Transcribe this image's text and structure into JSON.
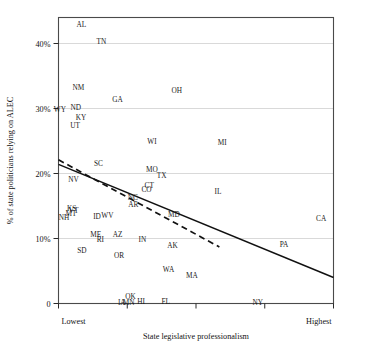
{
  "chart_data": {
    "type": "scatter",
    "title": "",
    "xlabel": "State legislative professionalism",
    "ylabel": "% of state politicians relying on ALEC",
    "xlim": [
      0,
      1
    ],
    "ylim": [
      0,
      0.44
    ],
    "grid": true,
    "legend": "none",
    "x_tick_labels": [
      "Lowest",
      "Highest"
    ],
    "x_tick_count": 5,
    "y_tick_labels": [
      "0",
      "10%",
      "20%",
      "30%",
      "40%"
    ],
    "y_tick_values": [
      0,
      10,
      20,
      30,
      40
    ],
    "point_label_field": "state",
    "points": [
      {
        "state": "AL",
        "x": 0.083,
        "y": 43.0
      },
      {
        "state": "TN",
        "x": 0.156,
        "y": 40.3
      },
      {
        "state": "NM",
        "x": 0.072,
        "y": 33.2
      },
      {
        "state": "OH",
        "x": 0.43,
        "y": 32.8
      },
      {
        "state": "GA",
        "x": 0.215,
        "y": 31.4
      },
      {
        "state": "WY",
        "x": 0.005,
        "y": 29.9
      },
      {
        "state": "ND",
        "x": 0.063,
        "y": 30.2
      },
      {
        "state": "KY",
        "x": 0.082,
        "y": 28.6
      },
      {
        "state": "UT",
        "x": 0.06,
        "y": 27.4
      },
      {
        "state": "WI",
        "x": 0.34,
        "y": 24.9
      },
      {
        "state": "MI",
        "x": 0.595,
        "y": 24.8
      },
      {
        "state": "SC",
        "x": 0.145,
        "y": 21.5
      },
      {
        "state": "MO",
        "x": 0.34,
        "y": 20.6
      },
      {
        "state": "TX",
        "x": 0.375,
        "y": 19.7
      },
      {
        "state": "NV",
        "x": 0.055,
        "y": 19.1
      },
      {
        "state": "CT",
        "x": 0.33,
        "y": 18.2
      },
      {
        "state": "CO",
        "x": 0.32,
        "y": 17.5
      },
      {
        "state": "IL",
        "x": 0.58,
        "y": 17.2
      },
      {
        "state": "NC",
        "x": 0.27,
        "y": 16.4
      },
      {
        "state": "AR",
        "x": 0.272,
        "y": 15.2
      },
      {
        "state": "KS",
        "x": 0.048,
        "y": 14.6
      },
      {
        "state": "MT",
        "x": 0.045,
        "y": 13.9
      },
      {
        "state": "VT",
        "x": 0.055,
        "y": 14.3
      },
      {
        "state": "NH",
        "x": 0.02,
        "y": 13.3
      },
      {
        "state": "ID",
        "x": 0.14,
        "y": 13.4
      },
      {
        "state": "WV",
        "x": 0.178,
        "y": 13.6
      },
      {
        "state": "MD",
        "x": 0.42,
        "y": 13.7
      },
      {
        "state": "CA",
        "x": 0.955,
        "y": 13.1
      },
      {
        "state": "ME",
        "x": 0.135,
        "y": 10.7
      },
      {
        "state": "AZ",
        "x": 0.215,
        "y": 10.6
      },
      {
        "state": "RI",
        "x": 0.152,
        "y": 9.8
      },
      {
        "state": "IN",
        "x": 0.305,
        "y": 9.8
      },
      {
        "state": "PA",
        "x": 0.82,
        "y": 9.1
      },
      {
        "state": "AK",
        "x": 0.415,
        "y": 9.0
      },
      {
        "state": "SD",
        "x": 0.085,
        "y": 8.2
      },
      {
        "state": "OR",
        "x": 0.22,
        "y": 7.4
      },
      {
        "state": "WA",
        "x": 0.4,
        "y": 5.3
      },
      {
        "state": "MA",
        "x": 0.485,
        "y": 4.3
      },
      {
        "state": "OK",
        "x": 0.262,
        "y": 1.1
      },
      {
        "state": "IA",
        "x": 0.23,
        "y": 0.2
      },
      {
        "state": "MN",
        "x": 0.255,
        "y": 0.2
      },
      {
        "state": "HI",
        "x": 0.3,
        "y": 0.3
      },
      {
        "state": "FL",
        "x": 0.39,
        "y": 0.4
      },
      {
        "state": "NY",
        "x": 0.725,
        "y": 0.2
      }
    ],
    "fit_lines": [
      {
        "name": "linear-fit-solid",
        "style": "solid",
        "x_start": 0.0,
        "y_start": 21.4,
        "x_end": 1.0,
        "y_end": 4.0
      },
      {
        "name": "local-fit-dashed",
        "style": "dashed",
        "x_start": 0.0,
        "y_start": 22.1,
        "x_end": 0.585,
        "y_end": 8.7
      }
    ]
  }
}
